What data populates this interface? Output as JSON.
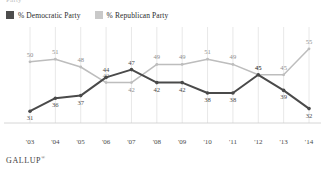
{
  "header": {
    "cropped_title_remnant": "Party",
    "source": "GALLUP",
    "source_mark": "®"
  },
  "legend": {
    "position": "top-left",
    "items": [
      {
        "label": "% Democratic Party",
        "color": "#4d4d4d",
        "marker": "square-swatch"
      },
      {
        "label": "% Republican Party",
        "color": "#c9c9c9",
        "marker": "square-swatch"
      }
    ]
  },
  "colors": {
    "democratic": "#4a4a4a",
    "republican": "#bdbdbd",
    "gridline": "#e2e2e2",
    "axis": "#cccccc",
    "label_text": "#4a4a4a"
  },
  "chart_data": {
    "type": "line",
    "title": "",
    "xlabel": "",
    "ylabel": "",
    "categories": [
      "'03",
      "'04",
      "'05",
      "'06",
      "'07",
      "'08",
      "'09",
      "'10",
      "'11",
      "'12",
      "'13",
      "'14"
    ],
    "series": [
      {
        "name": "% Democratic Party",
        "color": "#4a4a4a",
        "values": [
          31,
          36,
          37,
          44,
          47,
          42,
          42,
          38,
          38,
          45,
          39,
          32
        ],
        "label_positions": [
          "below",
          "below",
          "below",
          "above",
          "above",
          "below",
          "below",
          "below",
          "below",
          "above",
          "below",
          "below"
        ]
      },
      {
        "name": "% Republican Party",
        "color": "#bdbdbd",
        "values": [
          50,
          51,
          48,
          42,
          42,
          49,
          49,
          51,
          49,
          45,
          45,
          55
        ],
        "label_positions": [
          "above",
          "above",
          "above",
          "above",
          "below",
          "above",
          "above",
          "above",
          "above",
          "above",
          "above",
          "above"
        ]
      }
    ],
    "ylim": [
      28,
      58
    ],
    "grid": "vertical",
    "legend_position": "top-left",
    "markers": true
  }
}
